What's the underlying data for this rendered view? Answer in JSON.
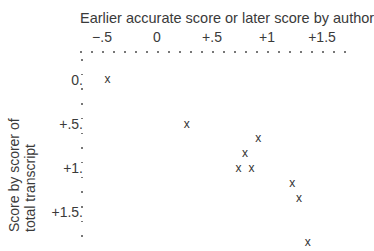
{
  "chart_data": {
    "type": "scatter",
    "title": "",
    "xlabel": "Earlier accurate score or later score by author",
    "ylabel": [
      "Score by scorer of",
      "total transcript"
    ],
    "x_ticks": [
      "−.5",
      "0",
      "+.5",
      "+1",
      "+1.5"
    ],
    "y_ticks": [
      "0.",
      "+.5.",
      "+1.",
      "+1.5."
    ],
    "xlim": [
      -0.5,
      1.6
    ],
    "ylim": [
      1.9,
      -0.1
    ],
    "x_axis_position": "top",
    "y_axis_inverted": true,
    "marker": "x",
    "grid": false,
    "points": [
      {
        "x": -0.45,
        "y": 0.0
      },
      {
        "x": 0.27,
        "y": 0.51
      },
      {
        "x": 0.92,
        "y": 0.67
      },
      {
        "x": 0.8,
        "y": 0.84
      },
      {
        "x": 0.74,
        "y": 1.01
      },
      {
        "x": 0.86,
        "y": 1.01
      },
      {
        "x": 1.23,
        "y": 1.18
      },
      {
        "x": 1.29,
        "y": 1.35
      },
      {
        "x": 1.37,
        "y": 1.85
      }
    ]
  }
}
